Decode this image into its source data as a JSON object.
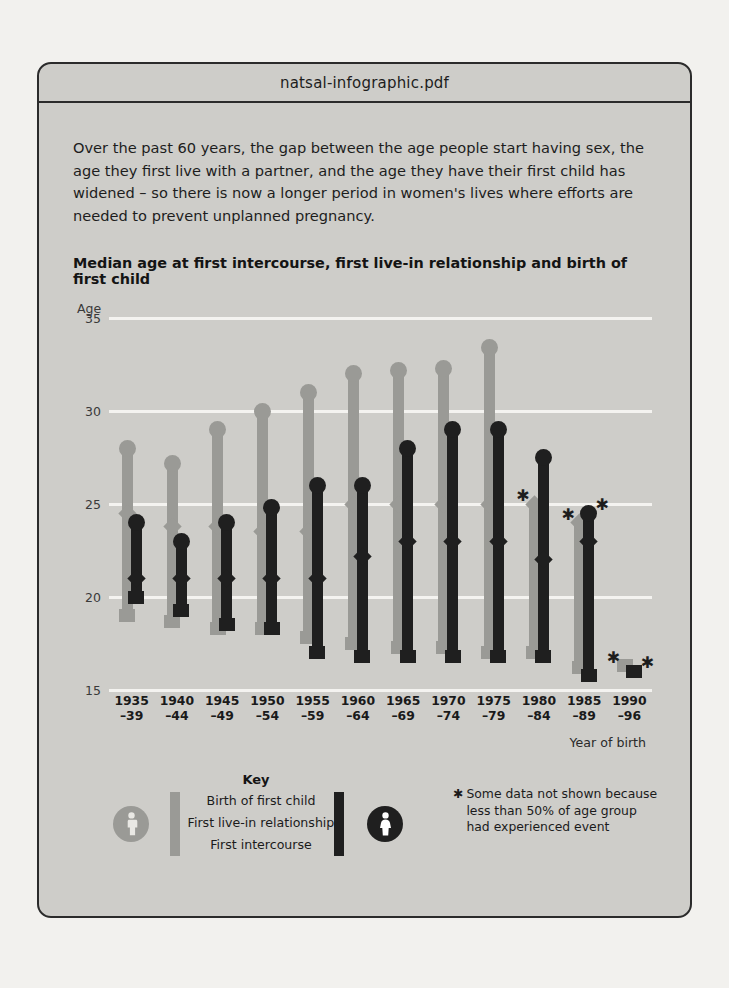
{
  "document": {
    "filename": "natsal-infographic.pdf",
    "intro": "Over the past 60 years, the gap between the age people start having sex, the age they first live with a partner, and the age they have their first child has widened – so there is now a longer period in women's lives where efforts are needed to prevent unplanned pregnancy."
  },
  "chart_data": {
    "type": "bar",
    "title": "Median age at first intercourse, first live-in relationship and birth of first child",
    "ylabel": "Age",
    "xlabel": "Year of birth",
    "ylim": [
      15,
      35
    ],
    "yticks": [
      "35",
      "30",
      "25",
      "20",
      "15"
    ],
    "grid": true,
    "legend_position": "bottom",
    "categories": [
      "1935\n–39",
      "1940\n–44",
      "1945\n–49",
      "1950\n–54",
      "1955\n–59",
      "1960\n–64",
      "1965\n–69",
      "1970\n–74",
      "1975\n–79",
      "1980\n–84",
      "1985\n–89",
      "1990\n–96"
    ],
    "category_labels": [
      {
        "top": "1935",
        "bottom": "–39"
      },
      {
        "top": "1940",
        "bottom": "–44"
      },
      {
        "top": "1945",
        "bottom": "–49"
      },
      {
        "top": "1950",
        "bottom": "–54"
      },
      {
        "top": "1955",
        "bottom": "–59"
      },
      {
        "top": "1960",
        "bottom": "–64"
      },
      {
        "top": "1965",
        "bottom": "–69"
      },
      {
        "top": "1970",
        "bottom": "–74"
      },
      {
        "top": "1975",
        "bottom": "–79"
      },
      {
        "top": "1980",
        "bottom": "–84"
      },
      {
        "top": "1985",
        "bottom": "–89"
      },
      {
        "top": "1990",
        "bottom": "–96"
      }
    ],
    "series": [
      {
        "name": "Men",
        "color": "#9a9a96",
        "events": {
          "birth_of_first_child": [
            28.0,
            27.2,
            29.0,
            30.0,
            31.0,
            32.0,
            32.2,
            32.3,
            33.4,
            null,
            null,
            null
          ],
          "first_live_in_relationship": [
            24.5,
            23.8,
            23.8,
            23.5,
            23.5,
            25.0,
            25.0,
            25.0,
            25.0,
            25.0,
            24.0,
            null
          ],
          "first_intercourse": [
            19.0,
            18.7,
            18.3,
            18.3,
            17.8,
            17.5,
            17.3,
            17.3,
            17.0,
            17.0,
            16.2,
            16.3
          ]
        },
        "asterisks": [
          {
            "category_index": 9,
            "event": "birth_of_first_child"
          },
          {
            "category_index": 10,
            "event": "birth_of_first_child"
          },
          {
            "category_index": 11,
            "event": "first_live_in_relationship"
          }
        ]
      },
      {
        "name": "Women",
        "color": "#1f1f1f",
        "events": {
          "birth_of_first_child": [
            24.0,
            23.0,
            24.0,
            24.8,
            26.0,
            26.0,
            28.0,
            29.0,
            29.0,
            27.5,
            24.5,
            null
          ],
          "first_live_in_relationship": [
            21.0,
            21.0,
            21.0,
            21.0,
            21.0,
            22.2,
            23.0,
            23.0,
            23.0,
            22.0,
            23.0,
            null
          ],
          "first_intercourse": [
            20.0,
            19.3,
            18.5,
            18.3,
            17.0,
            16.8,
            16.8,
            16.8,
            16.8,
            16.8,
            15.8,
            16.0
          ]
        },
        "asterisks": [
          {
            "category_index": 10,
            "event": "birth_of_first_child"
          },
          {
            "category_index": 11,
            "event": "first_live_in_relationship"
          }
        ]
      }
    ],
    "legend": {
      "heading": "Key",
      "entries": [
        {
          "label": "Birth of first child",
          "marker": "circle"
        },
        {
          "label": "First live-in relationship",
          "marker": "diamond"
        },
        {
          "label": "First intercourse",
          "marker": "square"
        }
      ],
      "male_icon": "male-person-icon",
      "female_icon": "female-person-icon"
    },
    "footnote": {
      "symbol": "✱",
      "lines": [
        "Some data not shown because",
        "less than 50% of age group",
        "had experienced event"
      ]
    }
  }
}
